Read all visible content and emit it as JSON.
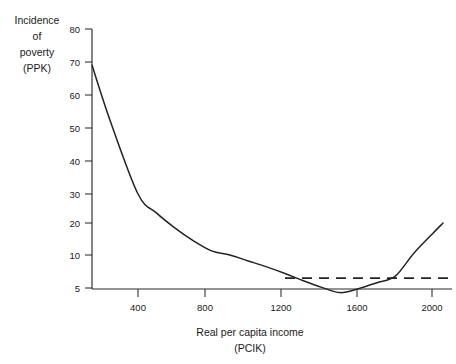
{
  "chart_data": {
    "type": "line",
    "title": "",
    "xlabel": "Real per capita income",
    "xlabel_sub": "(PCIK)",
    "ylabel_lines": [
      "Incidence",
      "of",
      "poverty",
      "(PPK)"
    ],
    "xlim": [
      150,
      2100
    ],
    "ylim": [
      4,
      80
    ],
    "grid": false,
    "legend": "none",
    "y_ticks": [
      80,
      70,
      60,
      50,
      40,
      30,
      20,
      10,
      5
    ],
    "y_tick_labels": [
      "80",
      "70",
      "60",
      "50",
      "40",
      "30",
      "20",
      "10",
      "5"
    ],
    "y_axis_note": "scale compressed between 10 and 5",
    "x_ticks": [
      400,
      800,
      1200,
      1600,
      2000
    ],
    "x_tick_labels": [
      "400",
      "800",
      "1200",
      "1600",
      "2000"
    ],
    "series": [
      {
        "name": "Incidence of poverty curve",
        "style": "solid",
        "x": [
          150,
          250,
          400,
          500,
          600,
          700,
          800,
          900,
          1000,
          1100,
          1200,
          1300,
          1400,
          1500,
          1600,
          1700,
          1800,
          1900,
          2000,
          2060
        ],
        "values": [
          69,
          52,
          30,
          23.5,
          18.5,
          14.5,
          11.3,
          10.0,
          9.1,
          8.2,
          7.2,
          6.1,
          5.1,
          4.3,
          4.9,
          5.8,
          6.8,
          10.5,
          16.5,
          20.0
        ]
      },
      {
        "name": "Reference poverty level",
        "style": "dashed",
        "x": [
          1200,
          2100
        ],
        "values": [
          6.5,
          6.5
        ]
      }
    ]
  },
  "axis_titles": {
    "y_line_1": "Incidence",
    "y_line_2": "of",
    "y_line_3": "poverty",
    "y_line_4": "(PPK)",
    "x_line_1": "Real per capita income",
    "x_line_2": "(PCIK)"
  },
  "y_tick_labels": {
    "t0": "80",
    "t1": "70",
    "t2": "60",
    "t3": "50",
    "t4": "40",
    "t5": "30",
    "t6": "20",
    "t7": "10",
    "t8": "5"
  },
  "x_tick_labels": {
    "t0": "400",
    "t1": "800",
    "t2": "1200",
    "t3": "1600",
    "t4": "2000"
  },
  "colors": {
    "ink": "#232323",
    "background": "#ffffff"
  }
}
